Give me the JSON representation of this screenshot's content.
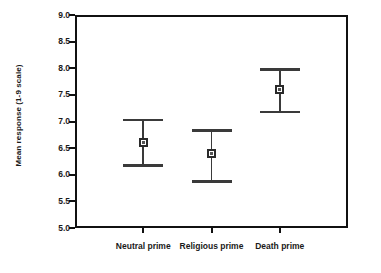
{
  "chart_data": {
    "type": "scatter",
    "title": "",
    "xlabel": "",
    "ylabel": "Mean response (1-9 scale)",
    "categories": [
      "Neutral prime",
      "Religious prime",
      "Death prime"
    ],
    "values": [
      6.6,
      6.4,
      7.6
    ],
    "error_low": [
      6.2,
      5.9,
      7.2
    ],
    "error_high": [
      7.05,
      6.85,
      8.0
    ],
    "ylim": [
      5.0,
      9.0
    ],
    "ytick_labels": [
      "9.0",
      "8.5",
      "8.0",
      "7.5",
      "7.0",
      "6.5",
      "6.0",
      "5.5",
      "5.0"
    ],
    "ytick_values": [
      9.0,
      8.5,
      8.0,
      7.5,
      7.0,
      6.5,
      6.0,
      5.5,
      5.0
    ],
    "grid": false,
    "legend": "none",
    "marker_color": "#555555",
    "error_color": "#3a3a3a",
    "axis_color": "#111111",
    "background": "#ffffff",
    "points": [
      {
        "category": "Neutral prime",
        "mean": 6.6,
        "low": 6.2,
        "high": 7.05
      },
      {
        "category": "Religious prime",
        "mean": 6.4,
        "low": 5.9,
        "high": 6.85
      },
      {
        "category": "Death prime",
        "mean": 7.6,
        "low": 7.2,
        "high": 8.0
      }
    ]
  }
}
